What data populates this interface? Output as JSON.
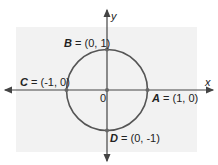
{
  "diagram": {
    "axes": {
      "x_label": "x",
      "y_label": "y",
      "origin_label": "0"
    },
    "circle": {
      "center": [
        0,
        0
      ],
      "radius": 1,
      "stroke": "#555555"
    },
    "points": [
      {
        "name": "A",
        "eq": " = (1, 0)",
        "coords": [
          1,
          0
        ]
      },
      {
        "name": "B",
        "eq": " = (0, 1)",
        "coords": [
          0,
          1
        ]
      },
      {
        "name": "C",
        "eq": " = (-1, 0)",
        "coords": [
          -1,
          0
        ]
      },
      {
        "name": "D",
        "eq": " = (0, -1)",
        "coords": [
          0,
          -1
        ]
      }
    ],
    "colors": {
      "panel": "#f2f2f2",
      "axis": "#444444",
      "circle": "#555555",
      "point": "#666666"
    }
  }
}
